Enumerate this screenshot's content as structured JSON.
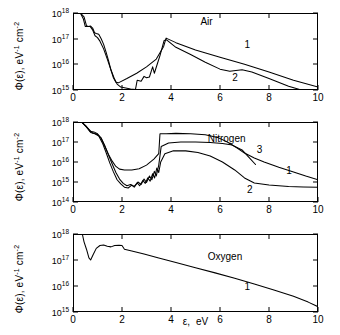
{
  "axes": {
    "x_title_symbol": "ε,",
    "x_title_unit": "eV",
    "y_title": "Φ(ε),  eV",
    "y_title_exp1": "-1",
    "y_title_mid": " cm",
    "y_title_exp2": "-2",
    "x_ticks": [
      "0",
      "2",
      "4",
      "6",
      "8",
      "10"
    ],
    "y_ticks_4": [
      "10",
      "10",
      "10",
      "10"
    ],
    "y_exp_air": [
      "18",
      "17",
      "16",
      "15"
    ],
    "y_exp_nitrogen": [
      "18",
      "17",
      "16",
      "15",
      "14"
    ],
    "y_exp_oxygen": [
      "18",
      "17",
      "16",
      "15"
    ]
  },
  "panels": [
    {
      "id": "air",
      "gas_label": "Air",
      "curve_labels": [
        "1",
        "2"
      ],
      "ylim_exp": [
        15,
        18
      ],
      "xlim": [
        0,
        10
      ]
    },
    {
      "id": "nitrogen",
      "gas_label": "Nitrogen",
      "curve_labels": [
        "3",
        "1",
        "2"
      ],
      "ylim_exp": [
        14,
        18
      ],
      "xlim": [
        0,
        10
      ]
    },
    {
      "id": "oxygen",
      "gas_label": "Oxygen",
      "curve_labels": [
        "1"
      ],
      "ylim_exp": [
        15,
        18
      ],
      "xlim": [
        0,
        10
      ]
    }
  ],
  "chart_data": {
    "type": "line",
    "title": "",
    "xlabel": "ε, eV",
    "ylabel": "Φ(ε), eV^-1 cm^-2",
    "yscale": "log",
    "xlim": [
      0,
      10
    ],
    "grid": false,
    "legend": "inline-curve-numbers",
    "panels": [
      {
        "name": "Air",
        "ylim": [
          1000000000000000.0,
          1e+18
        ],
        "series": [
          {
            "name": "1",
            "points": [
              [
                0.3,
                1e+18
              ],
              [
                0.45,
                7e+17
              ],
              [
                0.55,
                3.2e+17
              ],
              [
                0.62,
                3e+17
              ],
              [
                0.72,
                3.1e+17
              ],
              [
                0.8,
                2.6e+17
              ],
              [
                0.88,
                1.7e+17
              ],
              [
                0.95,
                1.6e+17
              ],
              [
                1.05,
                1.5e+17
              ],
              [
                1.15,
                1e+17
              ],
              [
                1.25,
                6e+16
              ],
              [
                1.35,
                3e+16
              ],
              [
                1.45,
                1.4e+16
              ],
              [
                1.55,
                6000000000000000.0
              ],
              [
                1.65,
                3000000000000000.0
              ],
              [
                1.75,
                2000000000000000.0
              ],
              [
                1.85,
                1900000000000000.0
              ],
              [
                2.2,
                2800000000000000.0
              ],
              [
                2.6,
                4500000000000000.0
              ],
              [
                3.0,
                8000000000000000.0
              ],
              [
                3.4,
                1.6e+16
              ],
              [
                3.7,
                5e+16
              ],
              [
                3.8,
                1.05e+17
              ],
              [
                4.2,
                7e+16
              ],
              [
                5.0,
                3.6e+16
              ],
              [
                6.0,
                1.9e+16
              ],
              [
                7.0,
                1e+16
              ],
              [
                8.0,
                5000000000000000.0
              ],
              [
                9.0,
                2400000000000000.0
              ],
              [
                10.0,
                1300000000000000.0
              ]
            ]
          },
          {
            "name": "2",
            "points": [
              [
                0.3,
                1e+18
              ],
              [
                0.42,
                6e+17
              ],
              [
                0.5,
                3e+17
              ],
              [
                0.6,
                3e+17
              ],
              [
                0.7,
                3e+17
              ],
              [
                0.8,
                2.2e+17
              ],
              [
                0.9,
                1.3e+17
              ],
              [
                1.0,
                1.1e+17
              ],
              [
                1.1,
                8e+16
              ],
              [
                1.25,
                4e+16
              ],
              [
                1.4,
                1.6e+16
              ],
              [
                1.55,
                6000000000000000.0
              ],
              [
                1.7,
                2600000000000000.0
              ],
              [
                1.8,
                1700000000000000.0
              ],
              [
                1.95,
                1300000000000000.0
              ],
              [
                2.15,
                1200000000000000.0
              ],
              [
                2.35,
                1100000000000000.0
              ],
              [
                2.55,
                1050000000000000.0
              ],
              [
                2.62,
                2400000000000000.0
              ],
              [
                2.78,
                2200000000000000.0
              ],
              [
                2.9,
                3400000000000000.0
              ],
              [
                3.0,
                3000000000000000.0
              ],
              [
                3.12,
                3200000000000000.0
              ],
              [
                3.25,
                8000000000000000.0
              ],
              [
                3.32,
                4500000000000000.0
              ],
              [
                3.45,
                1.1e+16
              ],
              [
                3.55,
                2.2e+16
              ],
              [
                3.72,
                8.5e+16
              ],
              [
                3.82,
                9e+16
              ],
              [
                4.2,
                4.6e+16
              ],
              [
                4.8,
                2.4e+16
              ],
              [
                5.4,
                1.2e+16
              ],
              [
                6.0,
                6500000000000000.0
              ],
              [
                6.4,
                5400000000000000.0
              ],
              [
                6.9,
                6200000000000000.0
              ],
              [
                7.3,
                5000000000000000.0
              ],
              [
                8.0,
                2800000000000000.0
              ],
              [
                8.8,
                1400000000000000.0
              ],
              [
                9.4,
                950000000000000.0
              ],
              [
                10.0,
                850000000000000.0
              ]
            ]
          }
        ]
      },
      {
        "name": "Nitrogen",
        "ylim": [
          100000000000000.0,
          1e+18
        ],
        "series": [
          {
            "name": "1",
            "points": [
              [
                0.35,
                1e+18
              ],
              [
                0.55,
                6e+17
              ],
              [
                0.7,
                3.4e+17
              ],
              [
                0.85,
                3.2e+17
              ],
              [
                1.0,
                2.6e+17
              ],
              [
                1.15,
                1.5e+17
              ],
              [
                1.3,
                6e+16
              ],
              [
                1.45,
                2.4e+16
              ],
              [
                1.6,
                1.1e+16
              ],
              [
                1.75,
                6000000000000000.0
              ],
              [
                1.9,
                4400000000000000.0
              ],
              [
                2.1,
                4000000000000000.0
              ],
              [
                2.4,
                4000000000000000.0
              ],
              [
                2.7,
                4600000000000000.0
              ],
              [
                3.0,
                7000000000000000.0
              ],
              [
                3.3,
                1.4e+16
              ],
              [
                3.5,
                2.6e+16
              ],
              [
                3.55,
                2.6e+17
              ],
              [
                3.8,
                2.6e+17
              ],
              [
                4.2,
                2.7e+17
              ],
              [
                4.8,
                2.6e+17
              ],
              [
                5.4,
                2.3e+17
              ],
              [
                5.9,
                1.7e+17
              ],
              [
                6.3,
                1e+17
              ],
              [
                6.7,
                5e+16
              ],
              [
                7.0,
                2.8e+16
              ],
              [
                7.4,
                1.6e+16
              ],
              [
                7.8,
                1e+16
              ],
              [
                8.4,
                5500000000000000.0
              ],
              [
                9.0,
                3200000000000000.0
              ],
              [
                9.5,
                2000000000000000.0
              ],
              [
                10.0,
                1300000000000000.0
              ]
            ]
          },
          {
            "name": "2",
            "points": [
              [
                0.35,
                1e+18
              ],
              [
                0.55,
                5.5e+17
              ],
              [
                0.72,
                3e+17
              ],
              [
                0.9,
                2.6e+17
              ],
              [
                1.05,
                2e+17
              ],
              [
                1.2,
                9e+16
              ],
              [
                1.35,
                3e+16
              ],
              [
                1.5,
                9000000000000000.0
              ],
              [
                1.65,
                3200000000000000.0
              ],
              [
                1.8,
                1300000000000000.0
              ],
              [
                1.95,
                800000000000000.0
              ],
              [
                2.1,
                550000000000000.0
              ],
              [
                2.25,
                500000000000000.0
              ],
              [
                2.4,
                700000000000000.0
              ],
              [
                2.5,
                550000000000000.0
              ],
              [
                2.62,
                900000000000000.0
              ],
              [
                2.72,
                650000000000000.0
              ],
              [
                2.85,
                1200000000000000.0
              ],
              [
                2.95,
                850000000000000.0
              ],
              [
                3.05,
                1600000000000000.0
              ],
              [
                3.15,
                1100000000000000.0
              ],
              [
                3.25,
                2600000000000000.0
              ],
              [
                3.33,
                1600000000000000.0
              ],
              [
                3.42,
                5000000000000000.0
              ],
              [
                3.5,
                3000000000000000.0
              ],
              [
                3.58,
                1e+16
              ],
              [
                3.75,
                2.6e+16
              ],
              [
                4.1,
                3.6e+16
              ],
              [
                4.6,
                3.6e+16
              ],
              [
                5.1,
                3e+16
              ],
              [
                5.6,
                2e+16
              ],
              [
                6.1,
                1e+16
              ],
              [
                6.6,
                4000000000000000.0
              ],
              [
                7.0,
                1600000000000000.0
              ],
              [
                7.4,
                900000000000000.0
              ],
              [
                8.0,
                700000000000000.0
              ],
              [
                8.8,
                600000000000000.0
              ],
              [
                9.4,
                560000000000000.0
              ],
              [
                10.0,
                540000000000000.0
              ]
            ]
          },
          {
            "name": "3",
            "points": [
              [
                0.35,
                1e+18
              ],
              [
                0.6,
                5e+17
              ],
              [
                0.8,
                2.8e+17
              ],
              [
                1.0,
                2.4e+17
              ],
              [
                1.15,
                1.6e+17
              ],
              [
                1.3,
                6.5e+16
              ],
              [
                1.45,
                2.2e+16
              ],
              [
                1.6,
                8000000000000000.0
              ],
              [
                1.75,
                3000000000000000.0
              ],
              [
                1.9,
                1400000000000000.0
              ],
              [
                2.05,
                850000000000000.0
              ],
              [
                2.2,
                650000000000000.0
              ],
              [
                2.35,
                750000000000000.0
              ],
              [
                2.5,
                600000000000000.0
              ],
              [
                2.65,
                1000000000000000.0
              ],
              [
                2.78,
                750000000000000.0
              ],
              [
                2.9,
                1400000000000000.0
              ],
              [
                3.0,
                950000000000000.0
              ],
              [
                3.12,
                2000000000000000.0
              ],
              [
                3.22,
                1300000000000000.0
              ],
              [
                3.32,
                3400000000000000.0
              ],
              [
                3.4,
                2000000000000000.0
              ],
              [
                3.5,
                7000000000000000.0
              ],
              [
                3.6,
                6e+16
              ],
              [
                3.9,
                9e+16
              ],
              [
                4.4,
                1e+17
              ],
              [
                5.0,
                1e+17
              ],
              [
                5.6,
                9.5e+16
              ],
              [
                6.1,
                8.5e+16
              ],
              [
                6.5,
                7e+16
              ],
              [
                6.9,
                4e+16
              ],
              [
                7.2,
                1.6e+16
              ],
              [
                7.45,
                7500000000000000.0
              ]
            ]
          }
        ]
      },
      {
        "name": "Oxygen",
        "ylim": [
          1000000000000000.0,
          1e+18
        ],
        "series": [
          {
            "name": "1",
            "points": [
              [
                0.38,
                1e+18
              ],
              [
                0.45,
                5e+17
              ],
              [
                0.55,
                2.6e+17
              ],
              [
                0.65,
                1.2e+17
              ],
              [
                0.72,
                1e+17
              ],
              [
                0.82,
                1.6e+17
              ],
              [
                0.95,
                2.8e+17
              ],
              [
                1.1,
                3.6e+17
              ],
              [
                1.25,
                3.8e+17
              ],
              [
                1.4,
                3.4e+17
              ],
              [
                1.55,
                3.2e+17
              ],
              [
                1.7,
                3.6e+17
              ],
              [
                1.88,
                3.7e+17
              ],
              [
                2.0,
                3.6e+17
              ],
              [
                2.1,
                2.6e+17
              ],
              [
                2.4,
                2.2e+17
              ],
              [
                2.9,
                1.7e+17
              ],
              [
                3.5,
                1.2e+17
              ],
              [
                4.2,
                8e+16
              ],
              [
                5.0,
                5e+16
              ],
              [
                5.8,
                3.2e+16
              ],
              [
                6.6,
                2e+16
              ],
              [
                7.4,
                1.2e+16
              ],
              [
                8.2,
                7000000000000000.0
              ],
              [
                9.0,
                4000000000000000.0
              ],
              [
                9.6,
                2400000000000000.0
              ],
              [
                10.0,
                1600000000000000.0
              ]
            ]
          }
        ]
      }
    ]
  }
}
